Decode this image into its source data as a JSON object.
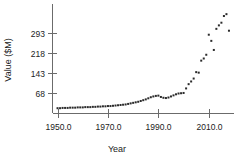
{
  "chart_data": {
    "type": "scatter",
    "title": "",
    "xlabel": "Year",
    "ylabel": "Value ($M)",
    "xlim": [
      1948,
      2020
    ],
    "ylim": [
      -8,
      400
    ],
    "grid": false,
    "legend": null,
    "xticks": [
      "1950.0",
      "1970.0",
      "1990.0",
      "2010.0"
    ],
    "xtick_values": [
      1950,
      1970,
      1990,
      2010
    ],
    "yticks": [
      "68",
      "143",
      "218",
      "293"
    ],
    "ytick_values": [
      68,
      143,
      218,
      293
    ],
    "marker": "filled-square",
    "marker_color": "#2b2b2b",
    "x": [
      1950,
      1951,
      1952,
      1953,
      1954,
      1955,
      1956,
      1957,
      1958,
      1959,
      1960,
      1961,
      1962,
      1963,
      1964,
      1965,
      1966,
      1967,
      1968,
      1969,
      1970,
      1971,
      1972,
      1973,
      1974,
      1975,
      1976,
      1977,
      1978,
      1979,
      1980,
      1981,
      1982,
      1983,
      1984,
      1985,
      1986,
      1987,
      1988,
      1989,
      1990,
      1991,
      1992,
      1993,
      1994,
      1995,
      1996,
      1997,
      1998,
      1999,
      2000,
      2001,
      2002,
      2003,
      2004,
      2005,
      2006,
      2007,
      2008,
      2009,
      2010,
      2011,
      2012,
      2013,
      2014,
      2015,
      2016,
      2017,
      2018
    ],
    "y": [
      10,
      10,
      11,
      11,
      11,
      12,
      12,
      12,
      13,
      13,
      13,
      14,
      14,
      14,
      15,
      15,
      16,
      16,
      17,
      17,
      18,
      18,
      19,
      20,
      21,
      22,
      23,
      24,
      26,
      28,
      30,
      32,
      34,
      37,
      40,
      43,
      47,
      51,
      54,
      56,
      57,
      52,
      49,
      48,
      50,
      54,
      58,
      62,
      65,
      66,
      67,
      84,
      100,
      110,
      121,
      145,
      143,
      188,
      196,
      210,
      285,
      262,
      228,
      307,
      320,
      330,
      355,
      362,
      300
    ]
  },
  "axis": {
    "y_label": "Value ($M)",
    "x_label": "Year"
  }
}
